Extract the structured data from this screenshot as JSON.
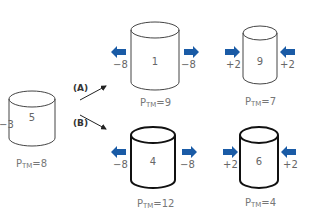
{
  "colors": {
    "arrow_blue": "#1a5ba6",
    "stroke": "#333333",
    "text": "#666666"
  },
  "initial": {
    "inside_value": "5",
    "outside_value": "−3",
    "ptm_prefix": "P",
    "ptm_sub": "TM",
    "ptm_value": "=8"
  },
  "branches": [
    {
      "label": "(A)"
    },
    {
      "label": "(B)"
    }
  ],
  "cells": [
    {
      "id": "A-hypotonic",
      "inside_value": "1",
      "left_flux": "−8",
      "right_flux": "−8",
      "flux_direction": "outward",
      "ptm_prefix": "P",
      "ptm_sub": "TM",
      "ptm_value": "=9",
      "wall": "thin"
    },
    {
      "id": "A-hypertonic",
      "inside_value": "9",
      "left_flux": "+2",
      "right_flux": "+2",
      "flux_direction": "inward",
      "ptm_prefix": "P",
      "ptm_sub": "TM",
      "ptm_value": "=7",
      "wall": "thin"
    },
    {
      "id": "B-hypotonic",
      "inside_value": "4",
      "left_flux": "−8",
      "right_flux": "−8",
      "flux_direction": "outward",
      "ptm_prefix": "P",
      "ptm_sub": "TM",
      "ptm_value": "=12",
      "wall": "thick"
    },
    {
      "id": "B-hypertonic",
      "inside_value": "6",
      "left_flux": "+2",
      "right_flux": "+2",
      "flux_direction": "inward",
      "ptm_prefix": "P",
      "ptm_sub": "TM",
      "ptm_value": "=4",
      "wall": "thick"
    }
  ]
}
